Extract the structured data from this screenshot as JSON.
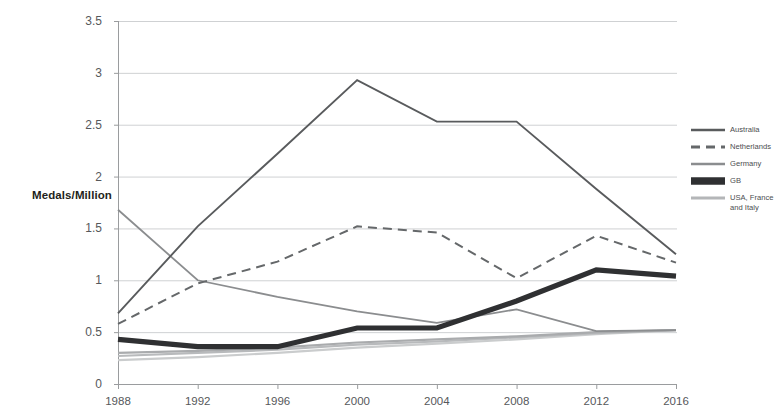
{
  "chart_data": {
    "type": "line",
    "title": "",
    "xlabel": "",
    "ylabel": "Medals/Million",
    "categories": [
      "1988",
      "1992",
      "1996",
      "2000",
      "2004",
      "2008",
      "2012",
      "2016"
    ],
    "x": [
      1988,
      1992,
      1996,
      2000,
      2004,
      2008,
      2012,
      2016
    ],
    "ylim": [
      0,
      3.5
    ],
    "ytick_labels": [
      "0",
      "0.5",
      "1",
      "1.5",
      "2",
      "2.5",
      "3",
      "3.5"
    ],
    "ytick_values": [
      0,
      0.5,
      1,
      1.5,
      2,
      2.5,
      3,
      3.5
    ],
    "grid": true,
    "grid_axis": "y",
    "legend_position": "right",
    "series": [
      {
        "name": "Australia",
        "values": [
          0.68,
          1.52,
          2.22,
          2.93,
          2.53,
          2.53,
          1.88,
          1.25
        ],
        "color": "#595b5d",
        "width": 1.9,
        "style": "solid"
      },
      {
        "name": "Netherlands",
        "values": [
          0.58,
          0.97,
          1.18,
          1.52,
          1.46,
          1.02,
          1.43,
          1.17
        ],
        "color": "#65686a",
        "width": 2.0,
        "style": "dashed"
      },
      {
        "name": "Germany",
        "values": [
          1.68,
          1.0,
          0.84,
          0.7,
          0.59,
          0.72,
          0.51,
          0.52
        ],
        "color": "#8b8d8f",
        "width": 1.8,
        "style": "solid"
      },
      {
        "name": "GB",
        "values": [
          0.43,
          0.36,
          0.36,
          0.54,
          0.54,
          0.8,
          1.1,
          1.04
        ],
        "color": "#2f3032",
        "width": 5.2,
        "style": "solid"
      },
      {
        "name": "USA, France\nand Italy",
        "values": [
          0.3,
          0.32,
          0.35,
          0.4,
          0.43,
          0.46,
          0.5,
          0.52
        ],
        "color": "#a9abad",
        "width": 2.2,
        "style": "solid"
      },
      {
        "name": "",
        "values": [
          0.27,
          0.3,
          0.33,
          0.38,
          0.41,
          0.45,
          0.49,
          0.52
        ],
        "color": "#b8babc",
        "width": 2.2,
        "style": "solid"
      },
      {
        "name": "",
        "values": [
          0.23,
          0.26,
          0.3,
          0.35,
          0.39,
          0.43,
          0.48,
          0.52
        ],
        "color": "#cacccd",
        "width": 2.2,
        "style": "solid"
      }
    ]
  },
  "legend": {
    "entries": [
      {
        "label": "Australia",
        "color": "#595b5d",
        "style": "solid",
        "width": 2.6
      },
      {
        "label": "Netherlands",
        "color": "#65686a",
        "style": "dashed",
        "width": 2.8
      },
      {
        "label": "Germany",
        "color": "#8b8d8f",
        "style": "solid",
        "width": 2.4
      },
      {
        "label": "GB",
        "color": "#2f3032",
        "style": "solid",
        "width": 7.5
      },
      {
        "label": "USA, France\nand Italy",
        "color": "#b4b6b8",
        "style": "solid",
        "width": 3.2
      }
    ]
  },
  "colors": {
    "grid": "#cfd1d3",
    "axis": "#9a9c9e",
    "tick_text": "#56585b",
    "axis_label": "#231f20",
    "background": "#ffffff"
  }
}
